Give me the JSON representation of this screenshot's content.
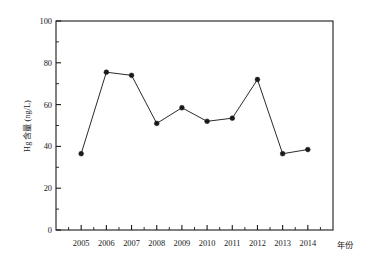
{
  "chart_data": {
    "type": "line",
    "title": "",
    "subtitle": "",
    "xlabel": "年份",
    "ylabel": "Hg 含量 (ng/L)",
    "categories": [
      "2005",
      "2006",
      "2007",
      "2008",
      "2009",
      "2010",
      "2011",
      "2012",
      "2013",
      "2014"
    ],
    "values": [
      36.5,
      75.5,
      74.0,
      51.0,
      58.5,
      52.0,
      53.5,
      72.0,
      36.5,
      38.5
    ],
    "series": [
      {
        "name": "Hg 含量",
        "values": [
          36.5,
          75.5,
          74.0,
          51.0,
          58.5,
          52.0,
          53.5,
          72.0,
          36.5,
          38.5
        ]
      }
    ],
    "ylim": [
      0,
      100
    ],
    "ytick_labels": [
      "0",
      "20",
      "40",
      "60",
      "80",
      "100"
    ],
    "ytick_values": [
      0,
      20,
      40,
      60,
      80,
      100
    ],
    "y_minor_ticks": true,
    "xtick_labels": [
      "2005",
      "2006",
      "2007",
      "2008",
      "2009",
      "2010",
      "2011",
      "2012",
      "2013",
      "2014"
    ],
    "x_minor_ticks": true,
    "grid": false,
    "legend": "none",
    "marker": "filled-circle",
    "line_color": "#2b2b2b",
    "marker_color": "#1a1a1a",
    "axis_color": "#1a1a1a",
    "background_color": "#ffffff",
    "frame": "box"
  },
  "labels": {
    "y_axis_title": "Hg 含量 (ng/L)",
    "x_axis_title": "年份"
  }
}
